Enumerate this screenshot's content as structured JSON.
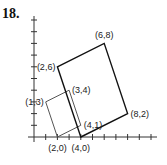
{
  "problem_number": "18.",
  "axes": {
    "x_max": 10,
    "y_max": 10,
    "tick_step": 1
  },
  "shapes": [
    {
      "name": "small-rectangle",
      "color": "#555555",
      "vertices": [
        [
          2,
          0
        ],
        [
          4,
          1
        ],
        [
          3,
          4
        ],
        [
          1,
          3
        ]
      ]
    },
    {
      "name": "large-rectangle",
      "color": "#111111",
      "vertices": [
        [
          4,
          0
        ],
        [
          8,
          2
        ],
        [
          6,
          8
        ],
        [
          2,
          6
        ]
      ]
    }
  ],
  "labels": [
    {
      "text": "(6,8)",
      "point": [
        6,
        8
      ],
      "anchor": "above"
    },
    {
      "text": "(2,6)",
      "point": [
        2,
        6
      ],
      "anchor": "left"
    },
    {
      "text": "(1,3)",
      "point": [
        1,
        3
      ],
      "anchor": "left"
    },
    {
      "text": "(3,4)",
      "point": [
        3,
        4
      ],
      "anchor": "right"
    },
    {
      "text": "(4,1)",
      "point": [
        4,
        1
      ],
      "anchor": "right"
    },
    {
      "text": "(8,2)",
      "point": [
        8,
        2
      ],
      "anchor": "right"
    },
    {
      "text": "(2,0)",
      "point": [
        2,
        0
      ],
      "anchor": "below"
    },
    {
      "text": "(4,0)",
      "point": [
        4,
        0
      ],
      "anchor": "below"
    }
  ]
}
